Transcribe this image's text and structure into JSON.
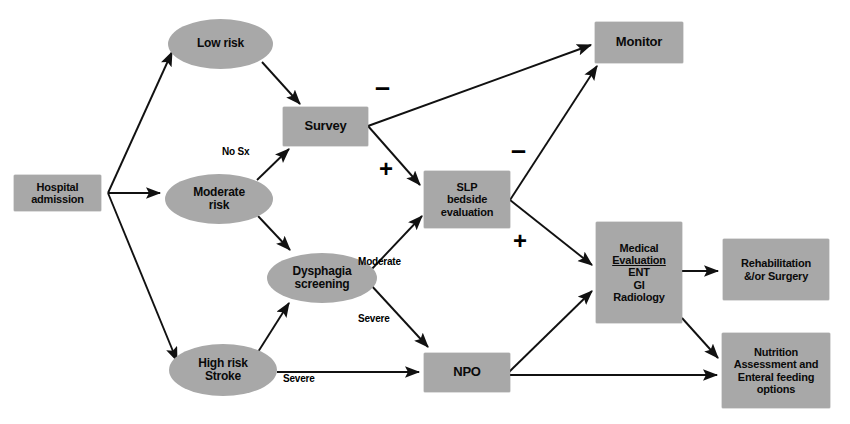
{
  "diagram": {
    "palette": {
      "node_fill": "#a8a8a8",
      "text": "#0a0a0a",
      "edge": "#111111",
      "background": "#ffffff"
    },
    "nodes": [
      {
        "id": "hospital-admission",
        "shape": "box",
        "lines": [
          "Hospital",
          "admission"
        ],
        "x": 14,
        "y": 175,
        "w": 87,
        "h": 36,
        "font": 11
      },
      {
        "id": "low-risk",
        "shape": "oval",
        "lines": [
          "Low risk"
        ],
        "x": 168,
        "y": 19,
        "w": 105,
        "h": 50,
        "font": 12
      },
      {
        "id": "moderate-risk",
        "shape": "oval",
        "lines": [
          "Moderate",
          "risk"
        ],
        "x": 165,
        "y": 174,
        "w": 108,
        "h": 50,
        "font": 12
      },
      {
        "id": "dysphagia-screening",
        "shape": "oval",
        "lines": [
          "Dysphagia",
          "screening"
        ],
        "x": 267,
        "y": 253,
        "w": 110,
        "h": 50,
        "font": 12
      },
      {
        "id": "high-risk-stroke",
        "shape": "oval",
        "lines": [
          "High risk",
          "Stroke"
        ],
        "x": 169,
        "y": 344,
        "w": 108,
        "h": 52,
        "font": 12
      },
      {
        "id": "survey",
        "shape": "box",
        "lines": [
          "Survey"
        ],
        "x": 283,
        "y": 107,
        "w": 85,
        "h": 39,
        "font": 13
      },
      {
        "id": "slp-bedside-evaluation",
        "shape": "box",
        "lines": [
          "SLP",
          "bedside",
          "evaluation"
        ],
        "x": 424,
        "y": 171,
        "w": 86,
        "h": 57,
        "font": 11
      },
      {
        "id": "npo",
        "shape": "box",
        "lines": [
          "NPO"
        ],
        "x": 424,
        "y": 353,
        "w": 86,
        "h": 39,
        "font": 13
      },
      {
        "id": "monitor",
        "shape": "box",
        "lines": [
          "Monitor"
        ],
        "x": 595,
        "y": 22,
        "w": 88,
        "h": 41,
        "font": 13
      },
      {
        "id": "medical-evaluation",
        "shape": "box",
        "lines": [
          "Medical",
          "Evaluation",
          "ENT",
          "GI",
          "Radiology"
        ],
        "underline_lines": [
          1
        ],
        "x": 596,
        "y": 222,
        "w": 86,
        "h": 101,
        "font": 11
      },
      {
        "id": "rehabilitation-surgery",
        "shape": "box",
        "lines": [
          "Rehabilitation",
          "&/or Surgery"
        ],
        "x": 723,
        "y": 239,
        "w": 106,
        "h": 61,
        "font": 11
      },
      {
        "id": "nutrition-assessment",
        "shape": "box",
        "lines": [
          "Nutrition",
          "Assessment and",
          "Enteral feeding",
          "options"
        ],
        "x": 722,
        "y": 333,
        "w": 108,
        "h": 75,
        "font": 11
      }
    ],
    "edge_labels": [
      {
        "id": "no-sx",
        "text": "No Sx",
        "x": 222,
        "y": 146,
        "font": 10
      },
      {
        "id": "moderate",
        "text": "Moderate",
        "x": 358,
        "y": 256,
        "font": 10
      },
      {
        "id": "severe-dysphagia",
        "text": "Severe",
        "x": 358,
        "y": 313,
        "font": 10
      },
      {
        "id": "severe-stroke",
        "text": "Severe",
        "x": 283,
        "y": 373,
        "font": 10
      }
    ],
    "signs": [
      {
        "id": "survey-to-monitor-negative",
        "text": "–",
        "x": 375,
        "y": 74,
        "font": 27
      },
      {
        "id": "survey-to-slp-positive",
        "text": "+",
        "x": 379,
        "y": 157,
        "font": 24
      },
      {
        "id": "slp-to-monitor-negative",
        "text": "–",
        "x": 511,
        "y": 137,
        "font": 27
      },
      {
        "id": "slp-to-medical-positive",
        "text": "+",
        "x": 513,
        "y": 229,
        "font": 24
      }
    ],
    "edges": [
      {
        "from": "hospital-admission",
        "to": "low-risk"
      },
      {
        "from": "hospital-admission",
        "to": "moderate-risk"
      },
      {
        "from": "hospital-admission",
        "to": "high-risk-stroke"
      },
      {
        "from": "low-risk",
        "to": "survey"
      },
      {
        "from": "moderate-risk",
        "to": "survey",
        "label": "No Sx"
      },
      {
        "from": "moderate-risk",
        "to": "dysphagia-screening"
      },
      {
        "from": "high-risk-stroke",
        "to": "dysphagia-screening"
      },
      {
        "from": "high-risk-stroke",
        "to": "npo",
        "label": "Severe"
      },
      {
        "from": "survey",
        "to": "monitor",
        "label": "-"
      },
      {
        "from": "survey",
        "to": "slp-bedside-evaluation",
        "label": "+"
      },
      {
        "from": "dysphagia-screening",
        "to": "slp-bedside-evaluation",
        "label": "Moderate"
      },
      {
        "from": "dysphagia-screening",
        "to": "npo",
        "label": "Severe"
      },
      {
        "from": "slp-bedside-evaluation",
        "to": "monitor",
        "label": "-"
      },
      {
        "from": "slp-bedside-evaluation",
        "to": "medical-evaluation",
        "label": "+"
      },
      {
        "from": "npo",
        "to": "medical-evaluation"
      },
      {
        "from": "npo",
        "to": "nutrition-assessment"
      },
      {
        "from": "medical-evaluation",
        "to": "rehabilitation-surgery"
      },
      {
        "from": "medical-evaluation",
        "to": "nutrition-assessment"
      }
    ]
  }
}
